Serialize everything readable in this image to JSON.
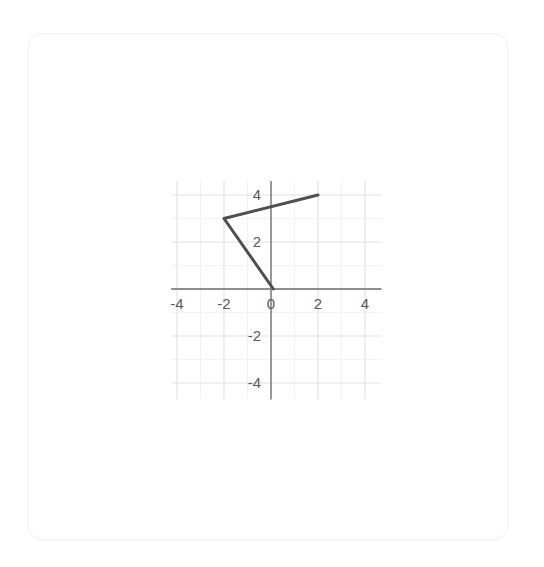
{
  "top_strip": {
    "clipped_text": "· ·· · ·                        ·"
  },
  "card": {
    "label": "graph card"
  },
  "chart_data": {
    "type": "line",
    "title": "",
    "subtitle": "",
    "xlabel": "",
    "ylabel": "",
    "xlim": [
      -4.25,
      4.7
    ],
    "ylim": [
      -4.7,
      4.6
    ],
    "xticks": [
      -4,
      -2,
      0,
      2,
      4
    ],
    "xtick_labels": [
      "-4",
      "-2",
      "0",
      "2",
      "4"
    ],
    "yticks": [
      4,
      2,
      0,
      -2,
      -4
    ],
    "ytick_labels": [
      "4",
      "2",
      "0",
      "-2",
      "-4"
    ],
    "grid": true,
    "grid_major_step": 2,
    "grid_minor_step": 1,
    "legend": "none",
    "series": [
      {
        "name": "polyline",
        "color": "#4f4f52",
        "width": 3,
        "points": [
          {
            "x": 0.1,
            "y": 0.0
          },
          {
            "x": -2.0,
            "y": 3.0
          },
          {
            "x": 2.0,
            "y": 4.0
          }
        ]
      }
    ],
    "axis_color": "#8e8e92",
    "grid_major_color": "#e2e2e8",
    "grid_minor_color": "#f2f2f6",
    "tick_label_color": "#58585c"
  }
}
